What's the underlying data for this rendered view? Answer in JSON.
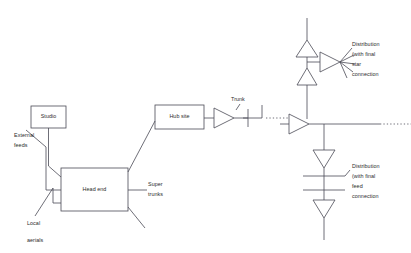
{
  "diagram": {
    "stroke_color": "#4a4a55",
    "text_color": "#2b2b2b",
    "background": "#ffffff",
    "boxes": [
      {
        "id": "studio",
        "label": "Studio",
        "x": 31,
        "y": 106,
        "w": 35,
        "h": 22
      },
      {
        "id": "headend",
        "label": "Head end",
        "x": 61,
        "y": 168,
        "w": 67,
        "h": 43
      },
      {
        "id": "hubsite",
        "label": "Hub site",
        "x": 155,
        "y": 105,
        "w": 49,
        "h": 24
      }
    ],
    "labels": [
      {
        "id": "external-feeds",
        "text": "External",
        "x": 14,
        "y": 131
      },
      {
        "id": "external-feeds-2",
        "text": "feeds",
        "x": 14,
        "y": 139
      },
      {
        "id": "local-aerials",
        "text": "Local",
        "x": 27,
        "y": 219
      },
      {
        "id": "local-aerials-2",
        "text": "aerials",
        "x": 27,
        "y": 236
      },
      {
        "id": "super-trunks",
        "text": "Super",
        "x": 148,
        "y": 180
      },
      {
        "id": "super-trunks-2",
        "text": "trunks",
        "x": 148,
        "y": 190
      },
      {
        "id": "trunk",
        "text": "Trunk",
        "x": 231,
        "y": 98
      },
      {
        "id": "dist-star-1",
        "text": "Distribution",
        "x": 352,
        "y": 43
      },
      {
        "id": "dist-star-2",
        "text": "(with final",
        "x": 352,
        "y": 53
      },
      {
        "id": "dist-star-3",
        "text": "star",
        "x": 352,
        "y": 63
      },
      {
        "id": "dist-star-4",
        "text": "connection",
        "x": 352,
        "y": 73
      },
      {
        "id": "dist-feed-1",
        "text": "Distribution",
        "x": 352,
        "y": 164
      },
      {
        "id": "dist-feed-2",
        "text": "(with final",
        "x": 352,
        "y": 174
      },
      {
        "id": "dist-feed-3",
        "text": "feed",
        "x": 352,
        "y": 184
      },
      {
        "id": "dist-feed-4",
        "text": "connection",
        "x": 352,
        "y": 194
      }
    ],
    "amplifiers": [
      {
        "id": "trunk-amplifier",
        "shape": "triangle-right",
        "x": 214,
        "y": 110
      },
      {
        "id": "distribution-amplifier",
        "shape": "triangle-right",
        "x": 289,
        "y": 119
      },
      {
        "id": "branch-amplifier-top",
        "shape": "triangle-up",
        "x": 297,
        "y": 40
      },
      {
        "id": "branch-amplifier-middle",
        "shape": "triangle-up",
        "x": 297,
        "y": 85
      },
      {
        "id": "star-amplifier",
        "shape": "triangle-right",
        "x": 320,
        "y": 62
      },
      {
        "id": "feed-amplifier-upper",
        "shape": "triangle-down",
        "x": 314,
        "y": 150
      },
      {
        "id": "feed-amplifier-lower",
        "shape": "triangle-down",
        "x": 314,
        "y": 200
      }
    ]
  }
}
